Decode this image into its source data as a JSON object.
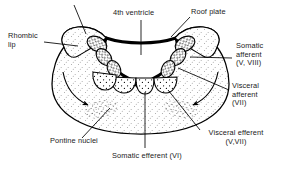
{
  "figure": {
    "line_color": "#000000",
    "fill_color": "#ffffff",
    "stipple_color": "#000000"
  },
  "labels": {
    "fourth_ventricle": "4th ventricle",
    "roof_plate": "Roof plate",
    "rhombic_lip_line1": "Rhombic",
    "rhombic_lip_line2": "lip",
    "somatic_afferent_line1": "Somatic",
    "somatic_afferent_line2": "afferent",
    "somatic_afferent_line3": "(V, VIII)",
    "visceral_afferent_line1": "Visceral",
    "visceral_afferent_line2": "afferent",
    "visceral_afferent_line3": "(VII)",
    "visceral_efferent_line1": "Visceral efferent",
    "visceral_efferent_line2": "(V,VII)",
    "pontine_nuclei": "Pontine nuclei",
    "somatic_efferent": "Somatic efferent (VI)"
  },
  "structures": {
    "somatic_afferent_nuclei_count": 6,
    "visceral_efferent_nuclei_count": 4,
    "pontine_nuclei_patches": 2,
    "migration_arrows": 2
  }
}
